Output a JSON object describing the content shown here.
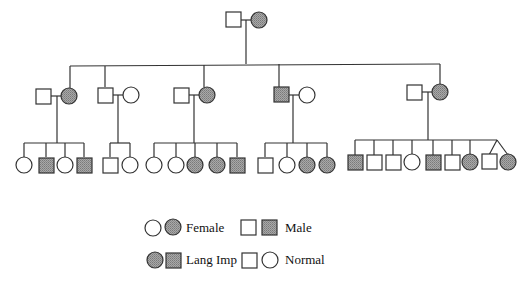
{
  "diagram": {
    "type": "pedigree",
    "colors": {
      "affected": "#9c9c9c",
      "normal": "#ffffff",
      "stroke": "#333333"
    },
    "generation1": {
      "couple": [
        {
          "sex": "male",
          "affected": false,
          "x": 233,
          "y": 20
        },
        {
          "sex": "female",
          "affected": true,
          "x": 259,
          "y": 20
        }
      ],
      "drop_x": 246
    },
    "sibship_line": {
      "y": 65,
      "x1": 70,
      "x2": 440
    },
    "generation2": [
      {
        "connect_x": 70,
        "spouse": {
          "sex": "male",
          "affected": false,
          "x": 44,
          "y": 96
        },
        "member": {
          "sex": "female",
          "affected": true,
          "x": 70,
          "y": 96
        },
        "drop_x": 57
      },
      {
        "connect_x": 105,
        "member": {
          "sex": "male",
          "affected": false,
          "x": 105,
          "y": 95
        },
        "spouse": {
          "sex": "female",
          "affected": false,
          "x": 131,
          "y": 95
        },
        "drop_x": 118
      },
      {
        "connect_x": 207,
        "spouse": {
          "sex": "male",
          "affected": false,
          "x": 181,
          "y": 95
        },
        "member": {
          "sex": "female",
          "affected": true,
          "x": 207,
          "y": 95
        },
        "drop_x": 194
      },
      {
        "connect_x": 286,
        "member": {
          "sex": "male",
          "affected": true,
          "x": 286,
          "y": 95
        },
        "spouse": {
          "sex": "female",
          "affected": false,
          "x": 312,
          "y": 95
        },
        "drop_x": 299
      },
      {
        "connect_x": 440,
        "spouse": {
          "sex": "male",
          "affected": false,
          "x": 414,
          "y": 92
        },
        "member": {
          "sex": "female",
          "affected": true,
          "x": 440,
          "y": 92
        },
        "drop_x": 428
      }
    ],
    "generation3": [
      {
        "family": 1,
        "children": [
          {
            "sex": "female",
            "affected": false,
            "x": 24
          },
          {
            "sex": "male",
            "affected": true,
            "x": 46
          },
          {
            "sex": "female",
            "affected": false,
            "x": 65
          },
          {
            "sex": "male",
            "affected": true,
            "x": 84
          }
        ]
      },
      {
        "family": 2,
        "children": [
          {
            "sex": "male",
            "affected": false,
            "x": 110
          },
          {
            "sex": "female",
            "affected": false,
            "x": 130
          }
        ]
      },
      {
        "family": 3,
        "children": [
          {
            "sex": "female",
            "affected": false,
            "x": 154
          },
          {
            "sex": "female",
            "affected": false,
            "x": 176
          },
          {
            "sex": "female",
            "affected": true,
            "x": 195
          },
          {
            "sex": "female",
            "affected": true,
            "x": 217
          },
          {
            "sex": "male",
            "affected": true,
            "x": 237
          }
        ]
      },
      {
        "family": 4,
        "children": [
          {
            "sex": "male",
            "affected": false,
            "x": 265
          },
          {
            "sex": "female",
            "affected": false,
            "x": 287
          },
          {
            "sex": "female",
            "affected": true,
            "x": 307
          },
          {
            "sex": "female",
            "affected": true,
            "x": 327
          }
        ]
      },
      {
        "family": 5,
        "children": [
          {
            "sex": "male",
            "affected": true,
            "x": 355
          },
          {
            "sex": "male",
            "affected": false,
            "x": 374
          },
          {
            "sex": "male",
            "affected": false,
            "x": 393
          },
          {
            "sex": "female",
            "affected": false,
            "x": 412
          },
          {
            "sex": "male",
            "affected": true,
            "x": 433
          },
          {
            "sex": "male",
            "affected": false,
            "x": 452
          },
          {
            "sex": "female",
            "affected": true,
            "x": 470
          },
          {
            "sex": "male",
            "affected": false,
            "x": 489,
            "twin": true
          },
          {
            "sex": "female",
            "affected": true,
            "x": 508,
            "twin": true
          }
        ]
      }
    ]
  },
  "legend": {
    "row1": {
      "female_label": "Female",
      "male_label": "Male"
    },
    "row2": {
      "affected_label": "Lang Imp",
      "normal_label": "Normal"
    }
  }
}
